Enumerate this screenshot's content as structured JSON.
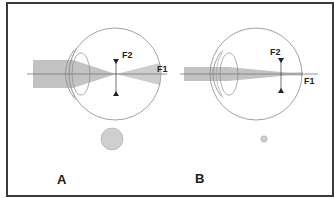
{
  "figure": {
    "panels": [
      {
        "id": "A",
        "label": "A",
        "description": "Large pupil: wide light beam, larger blur at retina",
        "focal_points": {
          "f1": "F1",
          "f2": "F2"
        },
        "pupil_size": "large"
      },
      {
        "id": "B",
        "label": "B",
        "description": "Small pupil: narrow light beam, smaller blur at retina",
        "focal_points": {
          "f1": "F1",
          "f2": "F2"
        },
        "pupil_size": "small"
      }
    ],
    "colors": {
      "frame": "#3a3a3a",
      "beam": "#b8b8b8",
      "eye_outline": "#8a8a8a",
      "axis": "#777777",
      "pupil_fill": "#cfcfcf",
      "text": "#1a1a1a"
    }
  }
}
